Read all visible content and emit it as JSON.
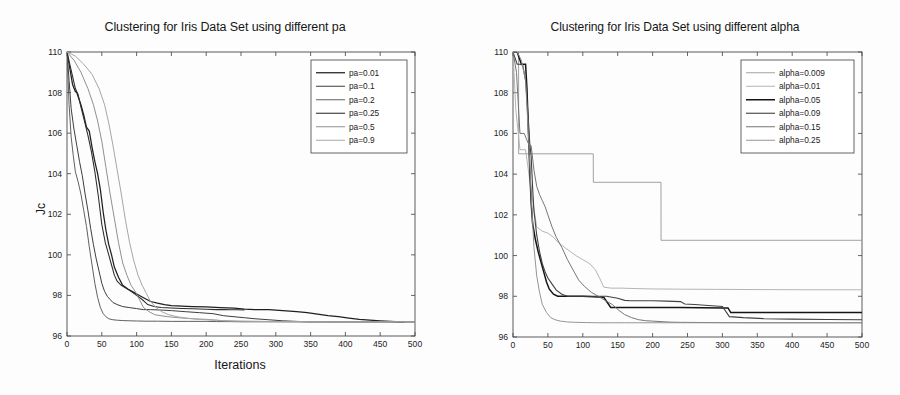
{
  "figure": {
    "panels": 2,
    "background_color": "#fdfdfd",
    "ink_color": "#1a1a1a"
  },
  "left_panel": {
    "title": "Clustering for Iris Data Set using different pa",
    "xlabel": "Iterations",
    "ylabel": "Jc"
  },
  "right_panel": {
    "title": "Clustering for Iris Data Set using different alpha",
    "xlabel": "Iterations",
    "ylabel": "Jc"
  },
  "chart_data": [
    {
      "type": "line",
      "title": "Clustering for Iris Data Set using different pa",
      "xlabel": "Iterations",
      "ylabel": "Jc",
      "xlim": [
        0,
        500
      ],
      "ylim": [
        96,
        110
      ],
      "xticks": [
        0,
        50,
        100,
        150,
        200,
        250,
        300,
        350,
        400,
        450,
        500
      ],
      "yticks": [
        96,
        98,
        100,
        102,
        104,
        106,
        108,
        110
      ],
      "grid": false,
      "legend_position": "top-right",
      "series": [
        {
          "name": "pa=0.01",
          "color": "#1f1f1f",
          "width": 1.25,
          "dash": "none",
          "x": [
            0,
            4,
            8,
            12,
            14,
            20,
            24,
            28,
            32,
            36,
            40,
            44,
            48,
            52,
            56,
            60,
            64,
            68,
            74,
            80,
            88,
            96,
            104,
            112,
            120,
            130,
            140,
            150,
            165,
            180,
            200,
            220,
            240,
            255,
            270,
            290,
            300,
            315,
            330,
            345,
            360,
            375,
            390,
            405,
            420,
            435,
            450,
            465,
            478,
            485
          ],
          "y": [
            110,
            109.2,
            108.4,
            108.05,
            108.0,
            107.4,
            106.9,
            106.3,
            106.1,
            105.3,
            104.6,
            104.0,
            103.2,
            102.1,
            101.2,
            100.5,
            100.0,
            99.4,
            98.9,
            98.5,
            98.3,
            98.15,
            98.0,
            97.85,
            97.7,
            97.62,
            97.55,
            97.5,
            97.47,
            97.45,
            97.43,
            97.4,
            97.38,
            97.33,
            97.3,
            97.3,
            97.28,
            97.24,
            97.2,
            97.15,
            97.08,
            97.0,
            96.95,
            96.88,
            96.82,
            96.78,
            96.75,
            96.72,
            96.7,
            96.7
          ]
        },
        {
          "name": "pa=0.1",
          "color": "#3d3d3d",
          "width": 1.0,
          "dash": "none",
          "x": [
            0,
            3,
            6,
            10,
            14,
            18,
            22,
            26,
            30,
            34,
            38,
            42,
            46,
            50,
            54,
            58,
            62,
            66,
            72,
            80,
            90,
            100,
            110,
            120,
            135,
            150,
            170,
            190,
            210,
            225,
            240,
            255,
            270,
            290,
            310,
            330,
            345,
            360,
            400,
            450,
            500
          ],
          "y": [
            110,
            108.6,
            107.2,
            106.2,
            105.4,
            104.6,
            103.9,
            103.0,
            102.2,
            101.3,
            100.5,
            99.8,
            99.2,
            98.6,
            98.2,
            97.95,
            97.8,
            97.65,
            97.55,
            97.45,
            97.4,
            97.35,
            97.3,
            97.3,
            97.28,
            97.25,
            97.2,
            97.15,
            97.1,
            97.0,
            96.95,
            96.9,
            96.85,
            96.8,
            96.75,
            96.72,
            96.7,
            96.7,
            96.7,
            96.7,
            96.7
          ]
        },
        {
          "name": "pa=0.2",
          "color": "#575757",
          "width": 0.95,
          "dash": "none",
          "x": [
            0,
            3,
            6,
            9,
            12,
            16,
            20,
            24,
            28,
            32,
            36,
            40,
            44,
            48,
            52,
            56,
            60,
            66,
            72,
            80,
            90,
            100,
            115,
            130,
            150,
            175,
            200,
            215,
            230,
            250,
            275,
            300,
            340,
            400,
            460,
            500
          ],
          "y": [
            110,
            107.4,
            105.8,
            104.9,
            104.1,
            103.6,
            103.0,
            102.2,
            101.4,
            100.4,
            99.5,
            98.6,
            97.9,
            97.4,
            97.1,
            96.95,
            96.85,
            96.8,
            96.78,
            96.76,
            96.75,
            96.74,
            96.73,
            96.73,
            96.72,
            96.72,
            96.72,
            96.71,
            96.71,
            96.7,
            96.7,
            96.7,
            96.7,
            96.7,
            96.7,
            96.7
          ]
        },
        {
          "name": "pa=0.25",
          "color": "#2b2b2b",
          "width": 1.05,
          "dash": "none",
          "x": [
            0,
            4,
            8,
            12,
            16,
            20,
            25,
            30,
            35,
            40,
            45,
            50,
            55,
            60,
            64,
            68,
            72,
            78,
            85,
            92,
            100,
            108,
            116,
            125,
            135,
            150,
            165,
            180,
            200,
            215,
            225,
            235,
            245,
            255
          ],
          "y": [
            110,
            109.4,
            108.8,
            108.2,
            107.9,
            107.3,
            106.6,
            105.9,
            105.1,
            104.1,
            102.9,
            101.5,
            100.6,
            100.0,
            99.5,
            99.0,
            98.7,
            98.5,
            98.35,
            98.2,
            98.0,
            97.8,
            97.55,
            97.45,
            97.4,
            97.38,
            97.36,
            97.34,
            97.32,
            97.3,
            97.3,
            97.29,
            97.29,
            97.28
          ]
        },
        {
          "name": "pa=0.5",
          "color": "#8a8a8a",
          "width": 0.95,
          "dash": "none",
          "x": [
            0,
            10,
            20,
            30,
            38,
            44,
            50,
            56,
            62,
            68,
            74,
            80,
            86,
            92,
            98,
            104,
            110,
            118,
            126,
            135,
            145,
            160,
            180,
            200,
            215,
            225,
            240,
            260,
            300,
            340,
            400,
            460,
            500
          ],
          "y": [
            110,
            109.6,
            109.0,
            108.2,
            107.4,
            106.6,
            105.6,
            104.3,
            103.0,
            101.8,
            100.6,
            99.6,
            99.0,
            98.5,
            98.2,
            97.8,
            97.4,
            97.2,
            97.05,
            97.0,
            96.95,
            96.9,
            96.85,
            96.82,
            96.78,
            96.75,
            96.73,
            96.72,
            96.71,
            96.7,
            96.7,
            96.7,
            96.7
          ]
        },
        {
          "name": "pa=0.9",
          "color": "#a6a6a6",
          "width": 1.0,
          "dash": "none",
          "x": [
            0,
            12,
            24,
            36,
            46,
            54,
            60,
            66,
            72,
            78,
            84,
            90,
            96,
            102,
            108,
            114,
            120,
            128,
            136,
            146,
            158,
            172,
            190,
            210,
            230,
            250,
            280,
            320,
            380,
            440,
            500
          ],
          "y": [
            110,
            109.8,
            109.4,
            108.9,
            108.2,
            107.4,
            106.5,
            105.4,
            104.2,
            103.0,
            101.7,
            100.6,
            99.7,
            99.0,
            98.5,
            98.1,
            97.7,
            97.4,
            97.2,
            97.05,
            96.95,
            96.88,
            96.82,
            96.78,
            96.75,
            96.73,
            96.72,
            96.71,
            96.7,
            96.7,
            96.7
          ]
        }
      ]
    },
    {
      "type": "line",
      "title": "Clustering for Iris Data Set using different alpha",
      "xlabel": "Iterations",
      "ylabel": "Jc",
      "xlim": [
        0,
        500
      ],
      "ylim": [
        96,
        110
      ],
      "xticks": [
        0,
        50,
        100,
        150,
        200,
        250,
        300,
        350,
        400,
        450,
        500
      ],
      "yticks": [
        96,
        98,
        100,
        102,
        104,
        106,
        108,
        110
      ],
      "grid": false,
      "legend_position": "top-right",
      "series": [
        {
          "name": "alpha=0.009",
          "color": "#9c9c9c",
          "width": 0.95,
          "dash": "none",
          "x": [
            0,
            8,
            8.1,
            115,
            115.1,
            212,
            212.1,
            300,
            400,
            500
          ],
          "y": [
            110,
            110,
            105.0,
            105.0,
            103.6,
            103.6,
            100.75,
            100.75,
            100.75,
            100.75
          ]
        },
        {
          "name": "alpha=0.01",
          "color": "#b0b0b0",
          "width": 0.95,
          "dash": "none",
          "x": [
            0,
            4,
            10,
            18,
            26,
            34,
            42,
            50,
            58,
            66,
            74,
            82,
            90,
            100,
            110,
            118,
            124,
            130,
            140,
            155,
            175,
            200,
            240,
            290,
            350,
            420,
            500
          ],
          "y": [
            110,
            107.2,
            105.2,
            105.2,
            103.2,
            101.4,
            101.2,
            101.1,
            100.9,
            100.6,
            100.4,
            100.2,
            100.0,
            99.8,
            99.6,
            99.3,
            98.9,
            98.45,
            98.4,
            98.4,
            98.38,
            98.36,
            98.35,
            98.34,
            98.33,
            98.32,
            98.32
          ]
        },
        {
          "name": "alpha=0.05",
          "color": "#141414",
          "width": 1.5,
          "dash": "none",
          "x": [
            0,
            6,
            12,
            18,
            20,
            22,
            24,
            26,
            28,
            32,
            36,
            40,
            44,
            48,
            52,
            58,
            64,
            72,
            80,
            90,
            100,
            115,
            130,
            140,
            150,
            170,
            200,
            240,
            270,
            300,
            308,
            312,
            340,
            380,
            430,
            500
          ],
          "y": [
            110,
            110,
            109.4,
            109.4,
            108.2,
            106.2,
            104.2,
            102.6,
            101.6,
            100.8,
            100.2,
            99.7,
            99.2,
            98.7,
            98.35,
            98.1,
            98.0,
            98.0,
            98.0,
            98.0,
            98.0,
            97.98,
            97.95,
            97.45,
            97.45,
            97.45,
            97.45,
            97.45,
            97.44,
            97.43,
            97.43,
            97.2,
            97.2,
            97.2,
            97.2,
            97.2
          ]
        },
        {
          "name": "alpha=0.09",
          "color": "#414141",
          "width": 1.1,
          "dash": "none",
          "x": [
            0,
            6,
            10,
            14,
            18,
            22,
            24,
            26,
            28,
            30,
            34,
            38,
            42,
            46,
            50,
            56,
            62,
            70,
            78,
            88,
            100,
            112,
            124,
            134,
            142,
            150,
            160,
            168,
            180,
            200,
            220,
            240,
            246,
            260,
            280,
            300,
            310,
            330,
            360,
            400,
            450,
            500
          ],
          "y": [
            110,
            109.4,
            109.4,
            109.35,
            108.6,
            106.7,
            105.5,
            104.9,
            103.4,
            102.2,
            101.0,
            100.2,
            99.6,
            99.2,
            98.9,
            98.6,
            98.3,
            98.1,
            98.0,
            98.0,
            98.0,
            98.0,
            98.0,
            98.0,
            97.95,
            97.9,
            97.8,
            97.78,
            97.78,
            97.78,
            97.76,
            97.74,
            97.62,
            97.6,
            97.55,
            97.5,
            97.0,
            96.95,
            96.9,
            96.88,
            96.86,
            96.85
          ]
        },
        {
          "name": "alpha=0.15",
          "color": "#6f6f6f",
          "width": 0.95,
          "dash": "none",
          "x": [
            0,
            5,
            10,
            16,
            22,
            26,
            30,
            34,
            38,
            42,
            46,
            50,
            56,
            62,
            70,
            78,
            86,
            94,
            102,
            112,
            122,
            132,
            142,
            152,
            160,
            170,
            180,
            190,
            200,
            215,
            225,
            240,
            280,
            340,
            420,
            500
          ],
          "y": [
            110,
            109.0,
            106.0,
            106.0,
            105.5,
            105.4,
            104.2,
            103.4,
            103.0,
            102.7,
            102.4,
            102.0,
            101.4,
            100.9,
            100.4,
            99.8,
            99.3,
            98.8,
            98.5,
            98.2,
            98.0,
            97.8,
            97.6,
            97.3,
            97.1,
            96.95,
            96.85,
            96.8,
            96.78,
            96.75,
            96.73,
            96.72,
            96.71,
            96.7,
            96.7,
            96.7
          ]
        },
        {
          "name": "alpha=0.25",
          "color": "#8f8f8f",
          "width": 0.95,
          "dash": "none",
          "x": [
            0,
            6,
            12,
            18,
            22,
            26,
            30,
            34,
            38,
            42,
            48,
            54,
            60,
            68,
            78,
            90,
            105,
            120,
            140,
            160,
            180,
            200,
            240,
            300,
            380,
            450,
            500
          ],
          "y": [
            110,
            110,
            109.6,
            108.6,
            106.0,
            103.0,
            100.4,
            99.0,
            98.2,
            97.6,
            97.2,
            96.95,
            96.85,
            96.78,
            96.74,
            96.72,
            96.71,
            96.7,
            96.7,
            96.7,
            96.7,
            96.7,
            96.7,
            96.7,
            96.7,
            96.7,
            96.7
          ]
        }
      ]
    }
  ]
}
